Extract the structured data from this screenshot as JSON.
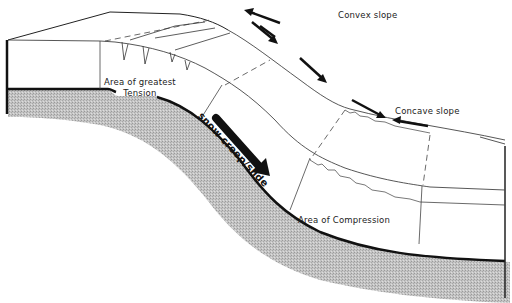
{
  "diagram": {
    "type": "cross-section block diagram",
    "labels": {
      "convex_slope": "Convex slope",
      "concave_slope": "Concave slope",
      "tension_line1": "Area of greatest",
      "tension_line2": "Tension",
      "compression": "Area of Compression",
      "snow_motion": "snow creep/slide"
    },
    "arrows": [
      {
        "name": "convex-upslope-arrow",
        "direction": "up-left"
      },
      {
        "name": "convex-downslope-arrow",
        "direction": "down-right"
      },
      {
        "name": "mid-slope-arrow",
        "direction": "down-right"
      },
      {
        "name": "concave-downslope-arrow",
        "direction": "down-right"
      },
      {
        "name": "concave-upslope-arrow",
        "direction": "left"
      },
      {
        "name": "snow-creep-big-arrow",
        "direction": "down-right"
      }
    ],
    "colors": {
      "ground_fill": "#b8b8b8",
      "outline": "#111111",
      "snow": "#ffffff",
      "thin_line": "#555555"
    }
  }
}
